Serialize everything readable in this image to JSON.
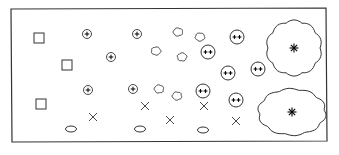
{
  "diagram": {
    "title": "",
    "stroke_color": "#333333",
    "background": "#ffffff",
    "frame": {
      "x1": 11,
      "y1": 9,
      "x2": 326,
      "y2": 8,
      "x3": 327,
      "y3": 141,
      "x4": 12,
      "y4": 142
    },
    "squares": [
      {
        "x": 39,
        "y": 38
      },
      {
        "x": 67,
        "y": 65
      },
      {
        "x": 41,
        "y": 104
      }
    ],
    "plus_circles": [
      {
        "x": 87,
        "y": 34
      },
      {
        "x": 137,
        "y": 34
      },
      {
        "x": 111,
        "y": 57
      },
      {
        "x": 88,
        "y": 90
      },
      {
        "x": 133,
        "y": 89
      }
    ],
    "small_blobs": [
      {
        "x": 178,
        "y": 32
      },
      {
        "x": 200,
        "y": 37
      },
      {
        "x": 156,
        "y": 51
      },
      {
        "x": 182,
        "y": 57
      },
      {
        "x": 159,
        "y": 89
      },
      {
        "x": 177,
        "y": 96
      }
    ],
    "double_plus_circles": [
      {
        "x": 237,
        "y": 37
      },
      {
        "x": 208,
        "y": 52
      },
      {
        "x": 228,
        "y": 73
      },
      {
        "x": 258,
        "y": 69
      },
      {
        "x": 203,
        "y": 91
      },
      {
        "x": 236,
        "y": 100
      }
    ],
    "crosses": [
      {
        "x": 93,
        "y": 117
      },
      {
        "x": 145,
        "y": 106
      },
      {
        "x": 170,
        "y": 120
      },
      {
        "x": 204,
        "y": 106
      },
      {
        "x": 236,
        "y": 121
      }
    ],
    "ovals": [
      {
        "x": 71,
        "y": 129
      },
      {
        "x": 140,
        "y": 129
      },
      {
        "x": 203,
        "y": 130
      }
    ],
    "large_clouds": [
      {
        "x": 294,
        "y": 48,
        "rx": 26,
        "ry": 26
      },
      {
        "x": 292,
        "y": 112,
        "rx": 32,
        "ry": 22
      }
    ],
    "legend_labels": {
      "squares": "square-cell",
      "plus_circles": "plus-circle",
      "small_blobs": "small-blob",
      "double_plus_circles": "double-plus-circle",
      "crosses": "cross-mark",
      "ovals": "oval",
      "large_clouds": "large-cloud-with-star"
    }
  }
}
